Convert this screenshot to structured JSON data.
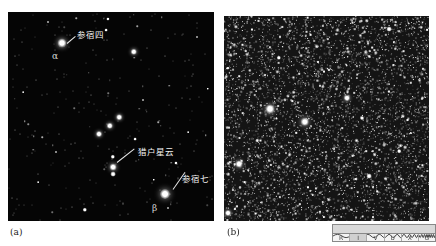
{
  "panel_a": {
    "caption": "(a)",
    "labels": [
      {
        "text": "参宿四",
        "x": 69,
        "y": 16
      },
      {
        "text": "猎户星云",
        "x": 130,
        "y": 133
      },
      {
        "text": "参宿七",
        "x": 174,
        "y": 160
      }
    ],
    "greek": [
      {
        "text": "α",
        "x": 44,
        "y": 39
      },
      {
        "text": "β",
        "x": 144,
        "y": 191
      }
    ],
    "leaders": [
      {
        "x": 59,
        "y": 31,
        "len": 11,
        "angle": -40
      },
      {
        "x": 109,
        "y": 150,
        "len": 22,
        "angle": -38
      },
      {
        "x": 165,
        "y": 177,
        "len": 21,
        "angle": -55
      }
    ],
    "stars": [
      {
        "x": 54,
        "y": 31,
        "r": 4.5
      },
      {
        "x": 126,
        "y": 40,
        "r": 3.2
      },
      {
        "x": 111,
        "y": 105,
        "r": 2.8
      },
      {
        "x": 102,
        "y": 114,
        "r": 3.2
      },
      {
        "x": 91,
        "y": 122,
        "r": 3.0
      },
      {
        "x": 105,
        "y": 145,
        "r": 2.2
      },
      {
        "x": 105,
        "y": 155,
        "r": 3.4
      },
      {
        "x": 105,
        "y": 162,
        "r": 2.4
      },
      {
        "x": 157,
        "y": 182,
        "r": 5.0
      },
      {
        "x": 77,
        "y": 198,
        "r": 2.2
      },
      {
        "x": 100,
        "y": 7,
        "r": 1.6
      },
      {
        "x": 98,
        "y": 18,
        "r": 1.4
      },
      {
        "x": 127,
        "y": 127,
        "r": 1.4
      },
      {
        "x": 168,
        "y": 151,
        "r": 1.6
      },
      {
        "x": 146,
        "y": 168,
        "r": 1.2
      },
      {
        "x": 40,
        "y": 10,
        "r": 1.0
      },
      {
        "x": 200,
        "y": 77,
        "r": 1.2
      },
      {
        "x": 48,
        "y": 140,
        "r": 1.0
      },
      {
        "x": 160,
        "y": 196,
        "r": 1.0
      },
      {
        "x": 189,
        "y": 25,
        "r": 1.0
      },
      {
        "x": 15,
        "y": 80,
        "r": 0.9
      },
      {
        "x": 135,
        "y": 88,
        "r": 1.0
      },
      {
        "x": 30,
        "y": 170,
        "r": 0.9
      },
      {
        "x": 180,
        "y": 120,
        "r": 0.9
      }
    ]
  },
  "panel_b": {
    "caption": "(b)",
    "bright_stars": [
      {
        "x": 46,
        "y": 93,
        "r": 4.5
      },
      {
        "x": 81,
        "y": 106,
        "r": 4.2
      },
      {
        "x": 15,
        "y": 148,
        "r": 3.5
      },
      {
        "x": 123,
        "y": 82,
        "r": 3.0
      },
      {
        "x": 55,
        "y": 42,
        "r": 2.2
      },
      {
        "x": 165,
        "y": 13,
        "r": 2.4
      },
      {
        "x": 145,
        "y": 160,
        "r": 2.4
      },
      {
        "x": 4,
        "y": 197,
        "r": 3.0
      },
      {
        "x": 138,
        "y": 102,
        "r": 2.0
      },
      {
        "x": 175,
        "y": 135,
        "r": 1.8
      }
    ]
  },
  "spectrum_bar": {
    "bands": [
      "R",
      "I",
      "V",
      "U",
      "X",
      "G"
    ]
  }
}
